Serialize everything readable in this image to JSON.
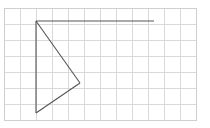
{
  "canvas": {
    "width": 210,
    "height": 128,
    "background_color": "#ffffff",
    "title": "Graph paper sketch of a right-pointing arrow outline"
  },
  "grid": {
    "cell_size": 16,
    "origin_x": 4,
    "origin_y": 8,
    "columns": 13,
    "rows": 7,
    "line_color": "#d9d9d9",
    "border_color": "#cfcfcf",
    "vertical_x": [
      4,
      20,
      36,
      52,
      68,
      84,
      100,
      116,
      132,
      148,
      164,
      180,
      196
    ],
    "horizontal_y": [
      8,
      24,
      40,
      56,
      72,
      88,
      104,
      120
    ]
  },
  "drawing": {
    "stroke_color": "#555555",
    "stroke_width": 1.1,
    "vertices": {
      "apex_top_left": {
        "x": 36,
        "y": 21
      },
      "bottom_left": {
        "x": 36,
        "y": 113
      },
      "right_point": {
        "x": 80,
        "y": 83
      },
      "ray_end_right": {
        "x": 154,
        "y": 21
      }
    },
    "segments": [
      {
        "name": "horizontal-ray",
        "x1": 36,
        "y1": 21,
        "x2": 154,
        "y2": 21
      },
      {
        "name": "left-vertical-edge",
        "x1": 36,
        "y1": 21,
        "x2": 36,
        "y2": 113
      },
      {
        "name": "upper-diagonal",
        "x1": 36,
        "y1": 21,
        "x2": 80,
        "y2": 83
      },
      {
        "name": "lower-diagonal",
        "x1": 80,
        "y1": 83,
        "x2": 36,
        "y2": 113
      }
    ]
  }
}
